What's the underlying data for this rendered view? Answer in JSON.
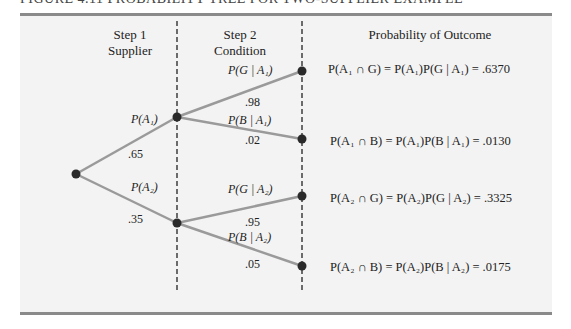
{
  "title": "FIGURE 4.11   PROBABILITY TREE FOR TWO-SUPPLIER EXAMPLE",
  "headers": {
    "step1_line1": "Step 1",
    "step1_line2": "Supplier",
    "step2_line1": "Step 2",
    "step2_line2": "Condition",
    "outcome": "Probability of Outcome"
  },
  "branches": {
    "a1_label": "P(A₁)",
    "a1_prob": ".65",
    "a2_label": "P(A₂)",
    "a2_prob": ".35",
    "g_a1_label": "P(G | A₁)",
    "g_a1_prob": ".98",
    "b_a1_label": "P(B | A₁)",
    "b_a1_prob": ".02",
    "g_a2_label": "P(G | A₂)",
    "g_a2_prob": ".95",
    "b_a2_label": "P(B | A₂)",
    "b_a2_prob": ".05"
  },
  "outcomes": [
    {
      "expr": "P(A₁ ∩ G) = P(A₁)P(G | A₁) = .6370",
      "value": ".6370"
    },
    {
      "expr": "P(A₁ ∩ B) = P(A₁)P(B | A₁) = .0130",
      "value": ".0130"
    },
    {
      "expr": "P(A₂ ∩ G) = P(A₂)P(G | A₂) = .3325",
      "value": ".3325"
    },
    {
      "expr": "P(A₂ ∩ B) = P(A₂)P(B | A₂) = .0175",
      "value": ".0175"
    }
  ],
  "colors": {
    "panel": "#f3f3f3",
    "branch": "#999999",
    "node": "#2a2a2a",
    "rule": "#8a8a8a"
  }
}
